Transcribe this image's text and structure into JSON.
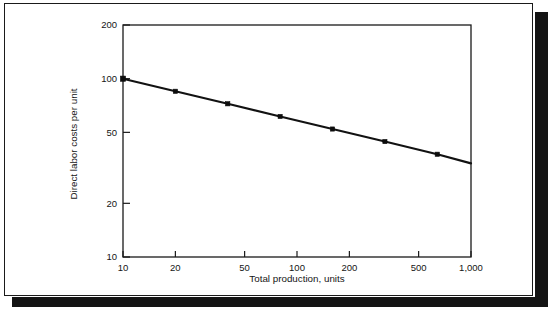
{
  "figure": {
    "frame_color": "#1a1a1a",
    "shadow_color": "#141414",
    "background": "#ffffff"
  },
  "chart_data": {
    "type": "line",
    "title": "",
    "subtitle": "",
    "xlabel": "Total production, units",
    "ylabel": "Direct labor costs per unit",
    "xscale": "log",
    "yscale": "log",
    "xlim": [
      10,
      1000
    ],
    "ylim": [
      10,
      200
    ],
    "xticks": [
      10,
      20,
      50,
      100,
      200,
      500,
      1000
    ],
    "xtick_labels": [
      "10",
      "20",
      "50",
      "100",
      "200",
      "500",
      "1,000"
    ],
    "yticks": [
      10,
      20,
      50,
      100,
      200
    ],
    "ytick_labels": [
      "10",
      "20",
      "50",
      "100",
      "200"
    ],
    "grid": false,
    "legend": null,
    "line_color": "#121212",
    "marker_color": "#0d0d0d",
    "series": [
      {
        "name": "Direct labor cost per unit",
        "marker": "square",
        "x": [
          10,
          20,
          40,
          80,
          160,
          320,
          640,
          1000
        ],
        "y": [
          100,
          85,
          72.3,
          61.4,
          52.2,
          44.4,
          37.7,
          33.5
        ],
        "marker_x": [
          10,
          20,
          40,
          80,
          160,
          320,
          640
        ],
        "marker_y": [
          100,
          85,
          72.3,
          61.4,
          52.2,
          44.4,
          37.7
        ]
      }
    ],
    "annotations": []
  }
}
